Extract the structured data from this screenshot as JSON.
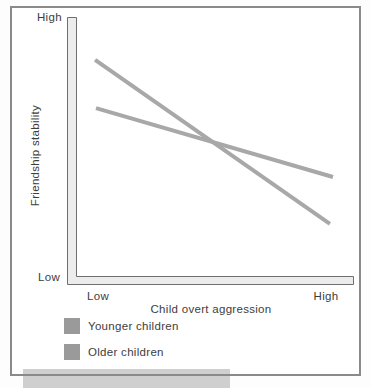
{
  "chart_data": {
    "type": "line",
    "title": "",
    "xlabel": "Child overt aggression",
    "ylabel": "Friendship stability",
    "x_tick_labels": [
      "Low",
      "High"
    ],
    "y_tick_labels": [
      "Low",
      "High"
    ],
    "x_range": [
      0,
      1
    ],
    "y_range": [
      0,
      1
    ],
    "grid": false,
    "legend_position": "bottom-left",
    "axis_style": {
      "bar_fill": "#ececec",
      "bar_edge": "#6f6f6f"
    },
    "series": [
      {
        "name": "Younger children",
        "color": "#a8a8a8",
        "swatch": "#9a9a9a",
        "points": [
          [
            0.098,
            0.84
          ],
          [
            0.916,
            0.228
          ]
        ]
      },
      {
        "name": "Older children",
        "color": "#a8a8a8",
        "swatch": "#9a9a9a",
        "points": [
          [
            0.101,
            0.66
          ],
          [
            0.927,
            0.403
          ]
        ]
      }
    ]
  },
  "decor": {
    "page_background": "#fdfdfd",
    "panel_background": "#ffffff",
    "panel_border": "#8a8a8a",
    "bottom_strip_color": "#cfcfcf"
  }
}
